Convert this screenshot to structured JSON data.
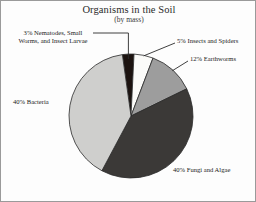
{
  "chart_data": {
    "type": "pie",
    "title": "Organisms in the Soil",
    "subtitle": "(by mass)",
    "xlabel": "",
    "ylabel": "",
    "legend_position": "none",
    "grid": false,
    "units": "percent by mass",
    "categories": [
      "Nematodes, Small Worms, and Insect Larvae",
      "Insects and Spiders",
      "Earthworms",
      "Fungi and Algae",
      "Bacteria"
    ],
    "values": [
      3,
      5,
      12,
      40,
      40
    ],
    "slices": [
      {
        "key": "nematodes",
        "label": "3%  Nematodes, Small Worms, and Insect Larvae",
        "short_label": "Nematodes, Small Worms, and Insect Larvae",
        "percent_text": "3%",
        "value": 3,
        "color": "#1c1310",
        "start_angle": 352,
        "end_angle": 362.8,
        "leader": true
      },
      {
        "key": "insects",
        "label": "5% Insects and Spiders",
        "short_label": "Insects and Spiders",
        "percent_text": "5%",
        "value": 5,
        "color": "#fbfbf9",
        "start_angle": 362.8,
        "end_angle": 380.8,
        "leader": true
      },
      {
        "key": "earthworms",
        "label": "12% Earthworms",
        "short_label": "Earthworms",
        "percent_text": "12%",
        "value": 12,
        "color": "#9d9d9d",
        "start_angle": 380.8,
        "end_angle": 424
      },
      {
        "key": "fungi",
        "label": "40% Fungi and Algae",
        "short_label": "Fungi and Algae",
        "percent_text": "40%",
        "value": 40,
        "color": "#3b3937",
        "start_angle": 424,
        "end_angle": 568
      },
      {
        "key": "bacteria",
        "label": "40% Bacteria",
        "short_label": "Bacteria",
        "percent_text": "40%",
        "value": 40,
        "color": "#cfcfcd",
        "start_angle": 568,
        "end_angle": 712
      }
    ],
    "geometry": {
      "cx": 130,
      "cy": 115,
      "r": 62
    },
    "colors": {
      "nematodes": "#1c1310",
      "insects": "#fbfbf9",
      "earthworms": "#9d9d9d",
      "fungi": "#3b3937",
      "bacteria": "#cfcfcd",
      "outline": "#2a2a2a",
      "frame": "#9a9a9a",
      "text": "#222222"
    }
  },
  "labels": {
    "nematodes_line1": "3%  Nematodes, Small",
    "nematodes_line2": "Worms, and Insect Larvae",
    "insects": "5% Insects and Spiders",
    "earthworms": "12% Earthworms",
    "fungi": "40% Fungi and Algae",
    "bacteria": "40% Bacteria"
  }
}
